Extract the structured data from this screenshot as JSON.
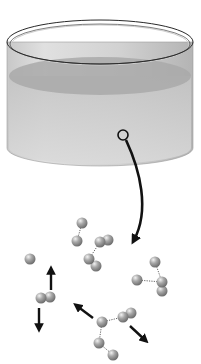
{
  "figure": {
    "colors": {
      "background": "#ffffff",
      "beaker_outline": "#2a2a2a",
      "water": "#bdbdbd",
      "water_surface": "#a6a6a6",
      "molecule": "#9a9a9a",
      "arrow": "#111111"
    },
    "beaker": {
      "cx": 100,
      "rim_cy": 42,
      "rx": 93,
      "rim_ry": 22,
      "base_cy": 148,
      "base_ry": 18,
      "surface_cy": 76,
      "surface_ry": 19
    },
    "magnifier_circle": {
      "cx": 123,
      "cy": 135,
      "r": 5
    },
    "molecules": [
      {
        "x": 82,
        "y": 223
      },
      {
        "x": 77,
        "y": 241
      },
      {
        "x": 100,
        "y": 242
      },
      {
        "x": 108,
        "y": 240
      },
      {
        "x": 89,
        "y": 259
      },
      {
        "x": 96,
        "y": 266
      },
      {
        "x": 30,
        "y": 259
      },
      {
        "x": 41,
        "y": 298
      },
      {
        "x": 50,
        "y": 297
      },
      {
        "x": 155,
        "y": 262
      },
      {
        "x": 137,
        "y": 280
      },
      {
        "x": 162,
        "y": 282
      },
      {
        "x": 162,
        "y": 291
      },
      {
        "x": 102,
        "y": 322
      },
      {
        "x": 123,
        "y": 317
      },
      {
        "x": 131,
        "y": 313
      },
      {
        "x": 99,
        "y": 343
      },
      {
        "x": 113,
        "y": 355
      }
    ],
    "hydrogen_bonds": [
      [
        82,
        223,
        77,
        241
      ],
      [
        100,
        242,
        89,
        259
      ],
      [
        137,
        280,
        162,
        282
      ],
      [
        155,
        262,
        162,
        282
      ],
      [
        102,
        322,
        123,
        317
      ],
      [
        102,
        322,
        99,
        343
      ],
      [
        99,
        343,
        113,
        355
      ]
    ],
    "motion_arrows": [
      {
        "x1": 51,
        "y1": 290,
        "x2": 51,
        "y2": 268
      },
      {
        "x1": 39,
        "y1": 308,
        "x2": 39,
        "y2": 330
      },
      {
        "x1": 93,
        "y1": 318,
        "x2": 75,
        "y2": 305
      },
      {
        "x1": 130,
        "y1": 326,
        "x2": 146,
        "y2": 342
      }
    ]
  }
}
